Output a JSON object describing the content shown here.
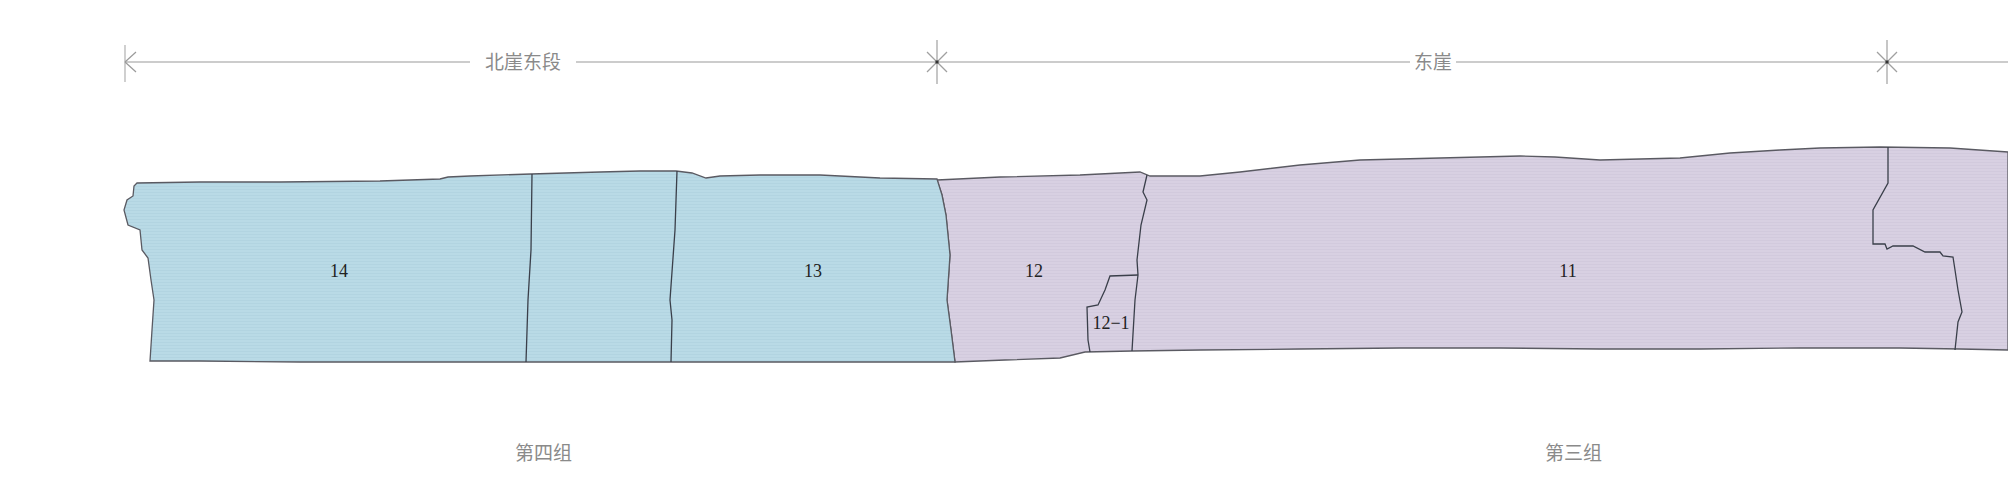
{
  "colors": {
    "group4_fill": "#b9dae6",
    "group3_fill": "#d8d0e2",
    "outline": "#5a5a62",
    "dimension_line": "#9a9a9a",
    "caption_text": "#8a8a8a",
    "label_text": "#222222"
  },
  "dimension_bar": {
    "segments": [
      {
        "label": "北崖东段",
        "start_x": 125,
        "end_x": 937
      },
      {
        "label": "东崖",
        "start_x": 937,
        "end_x": 1887
      }
    ],
    "markers": [
      "left-arrow-tick",
      "star-marker",
      "star-marker"
    ]
  },
  "sections": [
    {
      "id": "14",
      "label": "14",
      "group": "第四组"
    },
    {
      "id": "13",
      "label": "13",
      "group": "第四组"
    },
    {
      "id": "12",
      "label": "12",
      "group": "第三组"
    },
    {
      "id": "12-1",
      "label": "12−1",
      "group": "第三组"
    },
    {
      "id": "11",
      "label": "11",
      "group": "第三组"
    }
  ],
  "groups": [
    {
      "label": "第四组",
      "color": "#b9dae6"
    },
    {
      "label": "第三组",
      "color": "#d8d0e2"
    }
  ]
}
